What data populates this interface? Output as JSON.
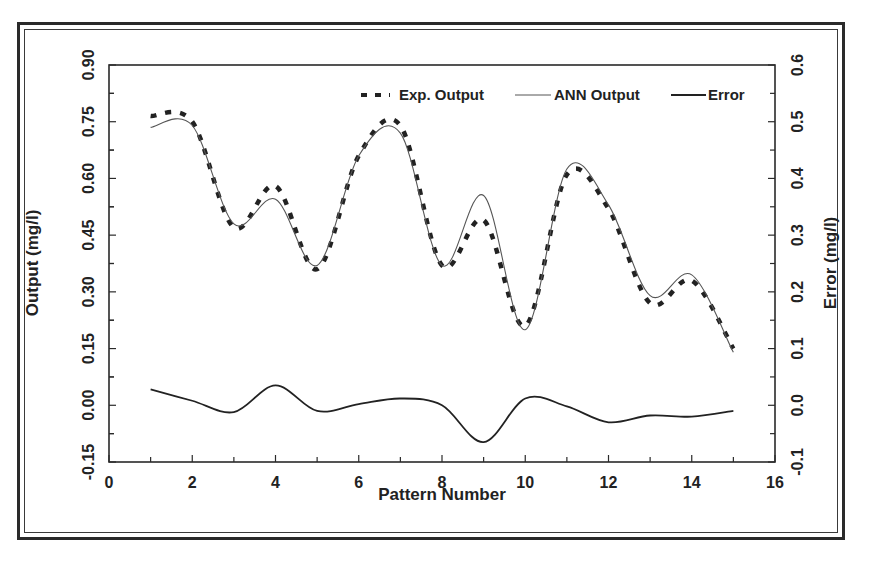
{
  "chart_data": {
    "type": "line",
    "title": "",
    "xlabel": "Pattern Number",
    "ylabel": "Output (mg/l)",
    "y2label": "Error (mg/l)",
    "xlim": [
      0,
      16
    ],
    "ylim": [
      -0.15,
      0.9
    ],
    "y2lim": [
      -0.1,
      0.6
    ],
    "x_ticks": [
      "0",
      "2",
      "4",
      "6",
      "8",
      "10",
      "12",
      "14",
      "16"
    ],
    "y_ticks": [
      "-0.15",
      "0.00",
      "0.15",
      "0.30",
      "0.45",
      "0.60",
      "0.75",
      "0.90"
    ],
    "y2_ticks": [
      "-0.1",
      "0.0",
      "0.1",
      "0.2",
      "0.3",
      "0.4",
      "0.5",
      "0.6"
    ],
    "grid": false,
    "legend_position": "top-right inside",
    "x": [
      1,
      2,
      3,
      4,
      5,
      6,
      7,
      8,
      9,
      10,
      11,
      12,
      13,
      14,
      15
    ],
    "series": [
      {
        "name": "Exp. Output",
        "axis": "left",
        "style": "dashed-thick",
        "values": [
          0.765,
          0.75,
          0.47,
          0.58,
          0.36,
          0.66,
          0.74,
          0.37,
          0.49,
          0.21,
          0.61,
          0.52,
          0.27,
          0.33,
          0.15
        ]
      },
      {
        "name": "ANN Output",
        "axis": "left",
        "style": "thin-solid",
        "values": [
          0.735,
          0.74,
          0.48,
          0.545,
          0.37,
          0.66,
          0.72,
          0.37,
          0.555,
          0.2,
          0.625,
          0.53,
          0.29,
          0.345,
          0.14
        ]
      },
      {
        "name": "Error",
        "axis": "right",
        "style": "solid",
        "values": [
          0.028,
          0.008,
          -0.012,
          0.035,
          -0.01,
          0.002,
          0.012,
          0.0,
          -0.065,
          0.012,
          -0.002,
          -0.03,
          -0.018,
          -0.02,
          -0.01
        ]
      }
    ]
  },
  "legend": {
    "exp_label": "Exp. Output",
    "ann_label": "ANN Output",
    "error_label": "Error"
  },
  "axes": {
    "x_title": "Pattern Number",
    "y_title": "Output (mg/l)",
    "y2_title": "Error (mg/l)"
  },
  "colors": {
    "line": "#222222",
    "ann_line": "#555555",
    "frame": "#2a2a2a"
  }
}
